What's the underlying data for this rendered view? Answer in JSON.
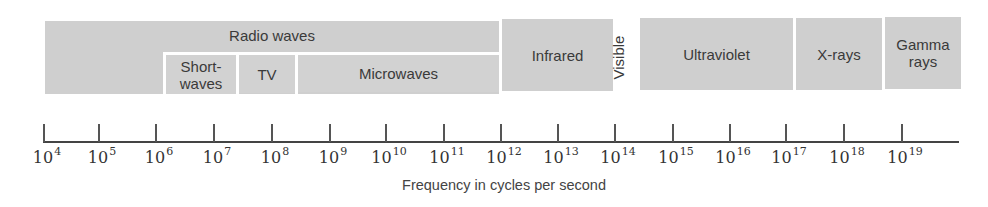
{
  "diagram": {
    "bands": {
      "radio": {
        "label": "Radio waves"
      },
      "shortwaves": {
        "label_line1": "Short-",
        "label_line2": "waves"
      },
      "tv": {
        "label": "TV"
      },
      "microwaves": {
        "label": "Microwaves"
      },
      "infrared": {
        "label": "Infrared"
      },
      "visible": {
        "label": "Visible"
      },
      "ultraviolet": {
        "label": "Ultraviolet"
      },
      "xrays": {
        "label": "X-rays"
      },
      "gamma": {
        "label_line1": "Gamma",
        "label_line2": "rays"
      }
    },
    "axis": {
      "caption": "Frequency in cycles per second",
      "ticks": [
        {
          "base": "10",
          "exp": "4"
        },
        {
          "base": "10",
          "exp": "5"
        },
        {
          "base": "10",
          "exp": "6"
        },
        {
          "base": "10",
          "exp": "7"
        },
        {
          "base": "10",
          "exp": "8"
        },
        {
          "base": "10",
          "exp": "9"
        },
        {
          "base": "10",
          "exp": "10"
        },
        {
          "base": "10",
          "exp": "11"
        },
        {
          "base": "10",
          "exp": "12"
        },
        {
          "base": "10",
          "exp": "13"
        },
        {
          "base": "10",
          "exp": "14"
        },
        {
          "base": "10",
          "exp": "15"
        },
        {
          "base": "10",
          "exp": "16"
        },
        {
          "base": "10",
          "exp": "17"
        },
        {
          "base": "10",
          "exp": "18"
        },
        {
          "base": "10",
          "exp": "19"
        }
      ]
    },
    "colors": {
      "band_fill": "#cfcfcf",
      "axis": "#444444",
      "text": "#3a3a3a"
    }
  }
}
